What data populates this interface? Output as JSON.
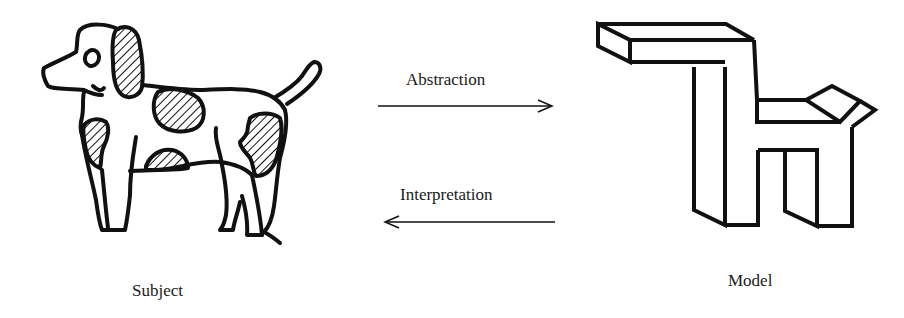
{
  "diagram": {
    "subject": {
      "label": "Subject",
      "icon": "dog-drawing-icon"
    },
    "model": {
      "label": "Model",
      "icon": "block-model-icon"
    },
    "arrows": [
      {
        "label": "Abstraction",
        "direction": "right",
        "from": "Subject",
        "to": "Model"
      },
      {
        "label": "Interpretation",
        "direction": "left",
        "from": "Model",
        "to": "Subject"
      }
    ],
    "colors": {
      "stroke": "#111111",
      "background": "#ffffff"
    }
  }
}
